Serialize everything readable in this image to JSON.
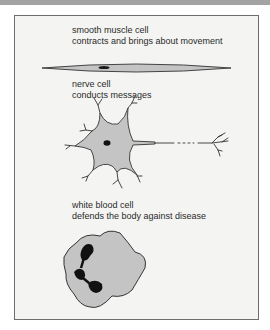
{
  "figure": {
    "sections": [
      {
        "id": "smooth-muscle",
        "title": "smooth muscle cell",
        "description": "contracts and brings about movement"
      },
      {
        "id": "nerve",
        "title": "nerve cell",
        "description": "conducts messages"
      },
      {
        "id": "white-blood",
        "title": "white blood cell",
        "description": "defends the body against disease"
      }
    ]
  },
  "colors": {
    "header_bar": "#a3a3a3",
    "panel_bg": "#f4f4f3",
    "panel_border": "#6d6d6d",
    "cell_fill": "#c4c4c4",
    "nucleus": "#1a1a1a",
    "outline": "#333333"
  }
}
